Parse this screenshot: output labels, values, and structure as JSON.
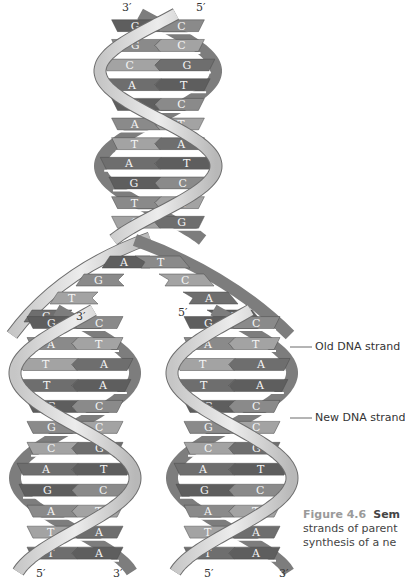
{
  "figure": {
    "number": "Figure 4.6",
    "title_visible": "Sem",
    "caption_lines": [
      "strands of parent",
      "synthesis of a ne"
    ]
  },
  "labels": {
    "old_strand": "Old DNA strand",
    "new_strand": "New DNA strand"
  },
  "end_labels": {
    "parent_top_left": "3′",
    "parent_top_right": "5′",
    "left_fork_top": "3′",
    "right_fork_top": "5′",
    "left_bottom_left": "5′",
    "left_bottom_right": "3′",
    "right_bottom_left": "5′",
    "right_bottom_right": "3′"
  },
  "parent_helix": {
    "base_pairs": [
      [
        "G",
        "C"
      ],
      [
        "G",
        "C"
      ],
      [
        "C",
        "G"
      ],
      [
        "A",
        "T"
      ],
      [
        "G",
        "C"
      ],
      [
        "A",
        "T"
      ],
      [
        "T",
        "A"
      ],
      [
        "A",
        "T"
      ],
      [
        "G",
        "C"
      ],
      [
        "T",
        "A"
      ],
      [
        "C",
        "G"
      ]
    ]
  },
  "fork": {
    "left_unpaired": [
      "A",
      "G",
      "T",
      "C"
    ],
    "right_unpaired": [
      "T",
      "C",
      "A",
      "G"
    ]
  },
  "daughter_left": {
    "base_pairs": [
      [
        "G",
        "C"
      ],
      [
        "A",
        "T"
      ],
      [
        "T",
        "A"
      ],
      [
        "T",
        "A"
      ],
      [
        "G",
        "C"
      ],
      [
        "G",
        "C"
      ],
      [
        "C",
        "G"
      ],
      [
        "A",
        "T"
      ],
      [
        "G",
        "C"
      ],
      [
        "A",
        "T"
      ],
      [
        "T",
        "A"
      ],
      [
        "T",
        "A"
      ]
    ]
  },
  "daughter_right": {
    "base_pairs": [
      [
        "G",
        "C"
      ],
      [
        "A",
        "T"
      ],
      [
        "T",
        "A"
      ],
      [
        "T",
        "A"
      ],
      [
        "G",
        "C"
      ],
      [
        "G",
        "C"
      ],
      [
        "C",
        "G"
      ],
      [
        "A",
        "T"
      ],
      [
        "G",
        "C"
      ],
      [
        "A",
        "T"
      ],
      [
        "T",
        "A"
      ],
      [
        "T",
        "A"
      ]
    ]
  },
  "colors": {
    "ribbon_light": "#d9d9d9",
    "ribbon_edge": "#6e6e6e",
    "base_dark": "#5e5e5e",
    "base_mid": "#8a8a8a",
    "base_light": "#a8a8a8"
  }
}
